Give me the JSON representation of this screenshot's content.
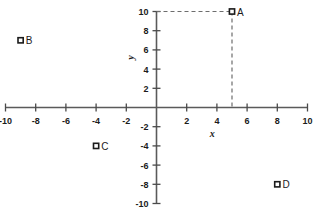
{
  "chart_data": {
    "type": "scatter",
    "title": "",
    "xlabel": "x",
    "ylabel": "y",
    "xlim": [
      -10,
      10
    ],
    "ylim": [
      -10,
      10
    ],
    "grid": false,
    "legend": "none",
    "xticks": [
      -10,
      -8,
      -6,
      -4,
      -2,
      2,
      4,
      6,
      8,
      10
    ],
    "yticks": [
      10,
      8,
      6,
      4,
      2,
      -2,
      -4,
      -6,
      -8,
      -10
    ],
    "xtick_labels": [
      "-10",
      "-8",
      "-6",
      "-4",
      "-2",
      "2",
      "4",
      "6",
      "8",
      "10"
    ],
    "ytick_labels": [
      "10",
      "8",
      "6",
      "4",
      "2",
      "-2",
      "-4",
      "-6",
      "-8",
      "-10"
    ],
    "marker": "open-square",
    "points": [
      {
        "label": "A",
        "x": 5,
        "y": 10
      },
      {
        "label": "B",
        "x": -9,
        "y": 7
      },
      {
        "label": "C",
        "x": -4,
        "y": -4
      },
      {
        "label": "D",
        "x": 8,
        "y": -8
      }
    ],
    "annotations": [
      {
        "name": "guide-horizontal-A",
        "from": [
          0,
          10
        ],
        "to": [
          5,
          10
        ],
        "style": "dashed"
      },
      {
        "name": "guide-vertical-A",
        "from": [
          5,
          10
        ],
        "to": [
          5,
          0
        ],
        "style": "dashed"
      }
    ],
    "colors": {
      "axis": "#5a5a5a",
      "text": "#1b1b1b",
      "guide": "#6d6d6d",
      "marker_fill": "#ffffff",
      "marker_stroke": "#1b1b1b",
      "background": "#ffffff"
    }
  }
}
